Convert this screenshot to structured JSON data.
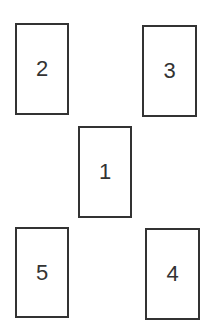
{
  "diagram": {
    "boxes": [
      {
        "label": "1",
        "x": 78,
        "y": 126,
        "w": 54,
        "h": 92
      },
      {
        "label": "2",
        "x": 15,
        "y": 23,
        "w": 54,
        "h": 92
      },
      {
        "label": "3",
        "x": 142,
        "y": 25,
        "w": 55,
        "h": 92
      },
      {
        "label": "4",
        "x": 145,
        "y": 228,
        "w": 55,
        "h": 92
      },
      {
        "label": "5",
        "x": 15,
        "y": 227,
        "w": 54,
        "h": 91
      }
    ],
    "colors": {
      "stroke": "#333333",
      "text": "#333333",
      "background": "#ffffff"
    }
  }
}
